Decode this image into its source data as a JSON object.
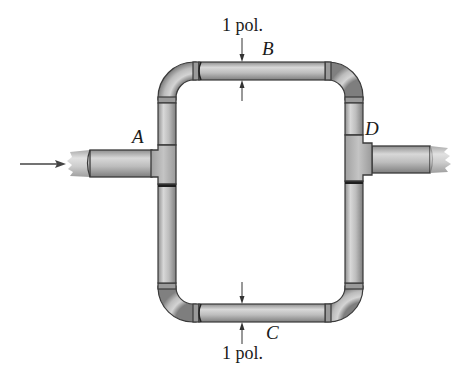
{
  "figure": {
    "type": "pipe-loop-diagram",
    "points": {
      "A": "A",
      "B": "B",
      "C": "C",
      "D": "D"
    },
    "dimensions": {
      "top": "1 pol.",
      "bottom": "1 pol."
    },
    "flow": {
      "direction": "left-to-right",
      "inlet": "A",
      "outlet": "D"
    },
    "colors": {
      "pipe_fill": "#b5b5b5",
      "pipe_highlight": "#dcdcdc",
      "pipe_shadow": "#8a8a8a",
      "outline": "#3a3a3a",
      "text": "#1a1a1a"
    }
  }
}
